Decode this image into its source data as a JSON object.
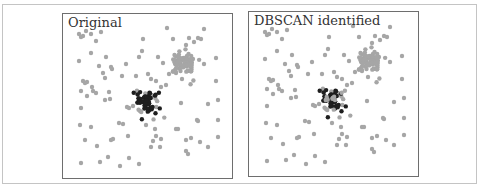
{
  "chart_data": [
    {
      "type": "scatter",
      "title": "Original",
      "xlabel": "",
      "ylabel": "",
      "grid": false,
      "legend": null,
      "series": [
        {
          "name": "noise / other cluster",
          "color": "#a6a6a6",
          "points": [
            [
              16,
              20
            ],
            [
              18,
              23
            ],
            [
              23,
              17
            ],
            [
              28,
              20
            ],
            [
              38,
              18
            ],
            [
              33,
              27
            ],
            [
              20,
              22
            ],
            [
              104,
              14
            ],
            [
              141,
              15
            ],
            [
              80,
              25
            ],
            [
              110,
              25
            ],
            [
              126,
              24
            ],
            [
              131,
              28
            ],
            [
              135,
              24
            ],
            [
              138,
              25
            ],
            [
              123,
              31
            ],
            [
              28,
              39
            ],
            [
              43,
              43
            ],
            [
              16,
              47
            ],
            [
              79,
              37
            ],
            [
              76,
              43
            ],
            [
              63,
              50
            ],
            [
              36,
              52
            ],
            [
              49,
              55
            ],
            [
              95,
              43
            ],
            [
              100,
              49
            ],
            [
              141,
              50
            ],
            [
              153,
              44
            ],
            [
              40,
              59
            ],
            [
              42,
              64
            ],
            [
              48,
              53
            ],
            [
              20,
              67
            ],
            [
              22,
              69
            ],
            [
              24,
              68
            ],
            [
              29,
              73
            ],
            [
              18,
              77
            ],
            [
              24,
              82
            ],
            [
              30,
              77
            ],
            [
              33,
              79
            ],
            [
              46,
              78
            ],
            [
              59,
              62
            ],
            [
              73,
              62
            ],
            [
              85,
              60
            ],
            [
              88,
              65
            ],
            [
              93,
              67
            ],
            [
              98,
              73
            ],
            [
              103,
              71
            ],
            [
              106,
              60
            ],
            [
              113,
              59
            ],
            [
              119,
              65
            ],
            [
              153,
              67
            ],
            [
              42,
              86
            ],
            [
              47,
              85
            ],
            [
              64,
              93
            ],
            [
              66,
              94
            ],
            [
              70,
              92
            ],
            [
              77,
              97
            ],
            [
              84,
              90
            ],
            [
              118,
              89
            ],
            [
              145,
              90
            ],
            [
              155,
              86
            ],
            [
              18,
              94
            ],
            [
              17,
              111
            ],
            [
              28,
              113
            ],
            [
              56,
              109
            ],
            [
              60,
              110
            ],
            [
              83,
              111
            ],
            [
              92,
              115
            ],
            [
              98,
              125
            ],
            [
              113,
              115
            ],
            [
              115,
              115
            ],
            [
              135,
              107
            ],
            [
              134,
              106
            ],
            [
              155,
              106
            ],
            [
              22,
              126
            ],
            [
              34,
              132
            ],
            [
              48,
              126
            ],
            [
              50,
              125
            ],
            [
              65,
              122
            ],
            [
              90,
              127
            ],
            [
              93,
              122
            ],
            [
              97,
              133
            ],
            [
              88,
              133
            ],
            [
              123,
              126
            ],
            [
              128,
              124
            ],
            [
              137,
              128
            ],
            [
              145,
              133
            ],
            [
              155,
              123
            ],
            [
              123,
              137
            ],
            [
              125,
              140
            ],
            [
              18,
              149
            ],
            [
              37,
              148
            ],
            [
              45,
              143
            ],
            [
              57,
              152
            ],
            [
              66,
              144
            ],
            [
              76,
              150
            ]
          ]
        },
        {
          "name": "dense gray cluster",
          "color": "#a6a6a6",
          "center": [
            120,
            50
          ],
          "approx_count": 60
        },
        {
          "name": "dense black cluster",
          "color": "#1e1e1e",
          "center": [
            82,
            87
          ],
          "approx_count": 55
        }
      ],
      "xlim": [
        0,
        170
      ],
      "ylim": [
        0,
        165
      ]
    },
    {
      "type": "scatter",
      "title": "DBSCAN identified",
      "xlabel": "",
      "ylabel": "",
      "grid": false,
      "legend": null,
      "series": [
        {
          "name": "noise / other cluster",
          "color": "#a6a6a6",
          "same_points_as": "Original"
        },
        {
          "name": "identified cluster",
          "color": "#1e1e1e",
          "center": [
            82,
            87
          ],
          "approx_count": 45
        }
      ],
      "xlim": [
        0,
        170
      ],
      "ylim": [
        0,
        165
      ]
    }
  ],
  "panels": {
    "left": {
      "title": "Original"
    },
    "right": {
      "title": "DBSCAN identified"
    }
  },
  "colors": {
    "point_gray": "#a6a6a6",
    "point_black": "#1e1e1e",
    "panel_border": "#6e6e6e",
    "frame_border": "#c4c4c4"
  }
}
